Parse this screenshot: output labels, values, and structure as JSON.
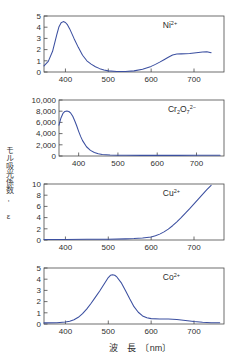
{
  "figure": {
    "y_axis_label": "モル吸光係数, ε",
    "x_axis_label": "波　長　〔nm〕",
    "line_color": "#3b4fa0",
    "axis_color": "#4a4a4a",
    "background": "#ffffff"
  },
  "chart_data": [
    {
      "type": "line",
      "title": "",
      "annotation": "Ni2+",
      "annotation_parts": {
        "base": "Ni",
        "sup": "2+"
      },
      "xlabel": "",
      "ylabel": "",
      "xlim": [
        350,
        770
      ],
      "ylim": [
        0,
        5
      ],
      "xticks": [
        400,
        500,
        600,
        700
      ],
      "yticks": [
        0,
        1,
        2,
        3,
        4,
        5
      ],
      "x": [
        350,
        360,
        370,
        380,
        385,
        390,
        395,
        400,
        405,
        410,
        420,
        430,
        440,
        450,
        460,
        470,
        480,
        490,
        500,
        520,
        540,
        560,
        580,
        600,
        610,
        620,
        630,
        640,
        650,
        660,
        670,
        680,
        690,
        700,
        710,
        720,
        730,
        740
      ],
      "y": [
        0.55,
        0.95,
        1.85,
        3.35,
        4.05,
        4.4,
        4.5,
        4.42,
        4.2,
        3.85,
        3.0,
        2.2,
        1.5,
        1.0,
        0.7,
        0.47,
        0.3,
        0.18,
        0.1,
        0.05,
        0.05,
        0.1,
        0.25,
        0.5,
        0.68,
        0.88,
        1.1,
        1.32,
        1.52,
        1.6,
        1.62,
        1.63,
        1.66,
        1.7,
        1.74,
        1.78,
        1.8,
        1.72
      ]
    },
    {
      "type": "line",
      "title": "",
      "annotation": "Cr2O7 2-",
      "annotation_parts": {
        "base1": "Cr",
        "sub1": "2",
        "base2": "O",
        "sub2": "7",
        "sup": "2−"
      },
      "xlabel": "",
      "ylabel": "",
      "xlim": [
        350,
        770
      ],
      "ylim": [
        0,
        10000
      ],
      "xticks": [
        400,
        500,
        600,
        700
      ],
      "yticks": [
        0,
        2000,
        4000,
        6000,
        8000,
        10000
      ],
      "ytick_labels": [
        "0",
        "2,000",
        "4,000",
        "6,000",
        "8,000",
        "10,000"
      ],
      "x": [
        350,
        355,
        360,
        365,
        370,
        375,
        380,
        385,
        390,
        395,
        400,
        405,
        410,
        420,
        430,
        440,
        450,
        460,
        480,
        500,
        520,
        560,
        600,
        650,
        700,
        740,
        760
      ],
      "y": [
        5500,
        6800,
        7600,
        7950,
        8050,
        7950,
        7650,
        7100,
        6300,
        5400,
        4400,
        3500,
        2750,
        1650,
        1000,
        620,
        400,
        280,
        170,
        130,
        120,
        110,
        110,
        115,
        125,
        135,
        140
      ]
    },
    {
      "type": "line",
      "title": "",
      "annotation": "Cu2+",
      "annotation_parts": {
        "base": "Cu",
        "sup": "2+"
      },
      "xlabel": "",
      "ylabel": "",
      "xlim": [
        350,
        770
      ],
      "ylim": [
        0,
        10
      ],
      "xticks": [
        400,
        500,
        600,
        700
      ],
      "yticks": [
        0,
        2,
        4,
        6,
        8,
        10
      ],
      "x": [
        350,
        400,
        450,
        500,
        540,
        560,
        580,
        600,
        610,
        620,
        630,
        640,
        650,
        660,
        670,
        680,
        690,
        700,
        710,
        720,
        730,
        740
      ],
      "y": [
        0.1,
        0.1,
        0.12,
        0.15,
        0.2,
        0.25,
        0.35,
        0.55,
        0.75,
        1.05,
        1.45,
        1.95,
        2.55,
        3.25,
        4.0,
        4.8,
        5.6,
        6.45,
        7.3,
        8.15,
        9.0,
        9.75
      ]
    },
    {
      "type": "line",
      "title": "",
      "annotation": "Co2+",
      "annotation_parts": {
        "base": "Co",
        "sup": "2+"
      },
      "xlabel": "波　長　〔nm〕",
      "ylabel": "",
      "xlim": [
        350,
        770
      ],
      "ylim": [
        0,
        5
      ],
      "xticks": [
        400,
        500,
        600,
        700
      ],
      "yticks": [
        0,
        1,
        2,
        3,
        4,
        5
      ],
      "x": [
        350,
        380,
        400,
        410,
        420,
        430,
        440,
        450,
        460,
        470,
        480,
        490,
        500,
        505,
        510,
        515,
        520,
        530,
        540,
        550,
        560,
        570,
        580,
        590,
        600,
        620,
        640,
        660,
        680,
        700,
        720,
        740,
        760
      ],
      "y": [
        0.1,
        0.12,
        0.18,
        0.25,
        0.38,
        0.6,
        0.92,
        1.35,
        1.85,
        2.4,
        2.95,
        3.55,
        4.15,
        4.35,
        4.4,
        4.35,
        4.2,
        3.7,
        3.0,
        2.25,
        1.55,
        1.05,
        0.72,
        0.55,
        0.48,
        0.45,
        0.44,
        0.4,
        0.32,
        0.22,
        0.15,
        0.12,
        0.12
      ]
    }
  ]
}
